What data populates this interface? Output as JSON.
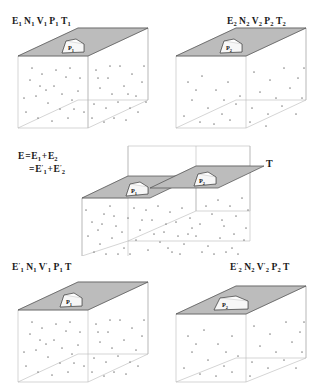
{
  "figure": {
    "type": "thermodynamics-schematic"
  },
  "panels": {
    "top_left": {
      "id": "panel-top-left",
      "label": "E₁ N₁ V₁ P₁ T₁",
      "label_parts": [
        {
          "sym": "E",
          "sub": "1",
          "prime": false
        },
        {
          "sym": "N",
          "sub": "1",
          "prime": false
        },
        {
          "sym": "V",
          "sub": "1",
          "prime": false
        },
        {
          "sym": "P",
          "sub": "1",
          "prime": false
        },
        {
          "sym": "T",
          "sub": "1",
          "prime": false
        }
      ],
      "piston_label": "P₁",
      "piston_sym": "P",
      "piston_sub": "1",
      "piston_prime": false,
      "particle_count": 46
    },
    "top_right": {
      "id": "panel-top-right",
      "label": "E₂ N₂ V₂ P₂ T₂",
      "label_parts": [
        {
          "sym": "E",
          "sub": "2",
          "prime": false
        },
        {
          "sym": "N",
          "sub": "2",
          "prime": false
        },
        {
          "sym": "V",
          "sub": "2",
          "prime": false
        },
        {
          "sym": "P",
          "sub": "2",
          "prime": false
        },
        {
          "sym": "T",
          "sub": "2",
          "prime": false
        }
      ],
      "piston_label": "P₂",
      "piston_sym": "P",
      "piston_sub": "2",
      "piston_prime": false,
      "particle_count": 30
    },
    "middle": {
      "id": "panel-middle",
      "equation_line1": "E = E₁ + E₂",
      "equation_line2": "= E′₁ + E′₂",
      "temperature_label": "T",
      "left_piston_label": "P₁",
      "right_piston_label": "P₂",
      "left_piston_sym": "P",
      "left_piston_sub": "1",
      "right_piston_sym": "P",
      "right_piston_sub": "2",
      "particle_count": 62
    },
    "bottom_left": {
      "id": "panel-bottom-left",
      "label": "E′₁ N₁ V′₁ P₁ T",
      "label_parts": [
        {
          "sym": "E",
          "sub": "1",
          "prime": true
        },
        {
          "sym": "N",
          "sub": "1",
          "prime": false
        },
        {
          "sym": "V",
          "sub": "1",
          "prime": true
        },
        {
          "sym": "P",
          "sub": "1",
          "prime": false
        },
        {
          "sym": "T",
          "sub": "",
          "prime": false
        }
      ],
      "piston_label": "P₁",
      "piston_sym": "P",
      "piston_sub": "1",
      "particle_count": 44
    },
    "bottom_right": {
      "id": "panel-bottom-right",
      "label": "E′₂ N₂ V′₂ P₂ T",
      "label_parts": [
        {
          "sym": "E",
          "sub": "2",
          "prime": true
        },
        {
          "sym": "N",
          "sub": "2",
          "prime": false
        },
        {
          "sym": "V",
          "sub": "2",
          "prime": true
        },
        {
          "sym": "P",
          "sub": "2",
          "prime": false
        },
        {
          "sym": "T",
          "sub": "",
          "prime": false
        }
      ],
      "piston_label": "P₂",
      "piston_sym": "P",
      "piston_sub": "2",
      "particle_count": 28
    }
  },
  "colors": {
    "lid_fill": "#bcbcbc",
    "lid_stroke": "#4a4a4a",
    "frame_stroke": "#b9b9b9",
    "dome_fill": "#fdfdfd",
    "particle": "#8a8a8a",
    "text": "#1a1a1a",
    "background": "#ffffff"
  }
}
